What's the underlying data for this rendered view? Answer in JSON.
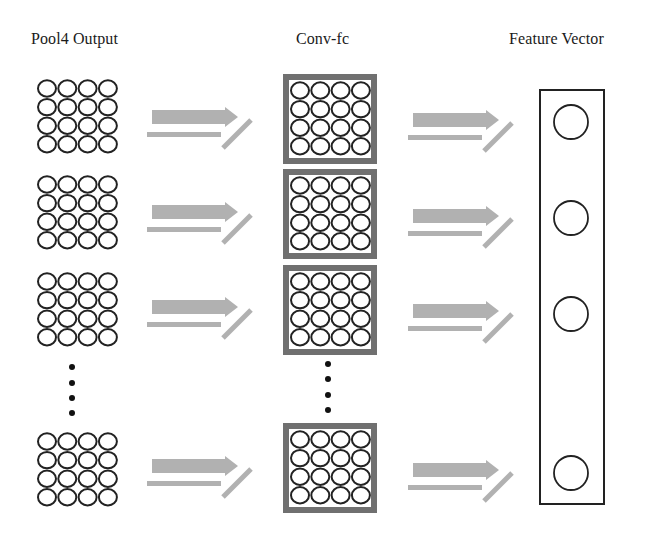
{
  "titles": {
    "pool4": "Pool4 Output",
    "convfc": "Conv-fc",
    "feature": "Feature Vector"
  },
  "colors": {
    "circle_stroke": "#222222",
    "conv_border": "#707070",
    "arrow_fill": "#a9a9a9",
    "box_stroke": "#222222",
    "dot": "#111111"
  },
  "layout": {
    "pool4_grids_y": [
      79,
      175,
      272,
      432
    ],
    "conv_boxes_y": [
      74,
      169,
      265,
      423
    ],
    "left_arrows_y": [
      117,
      212,
      307,
      466
    ],
    "right_arrows_y": [
      120,
      216,
      311,
      470
    ],
    "feature_circles_y": [
      122,
      218,
      314,
      473
    ],
    "grid_size": 4,
    "ellipsis_pool4_y": [
      367,
      383,
      398,
      413
    ],
    "ellipsis_conv_y": [
      364,
      379,
      395,
      410
    ]
  }
}
